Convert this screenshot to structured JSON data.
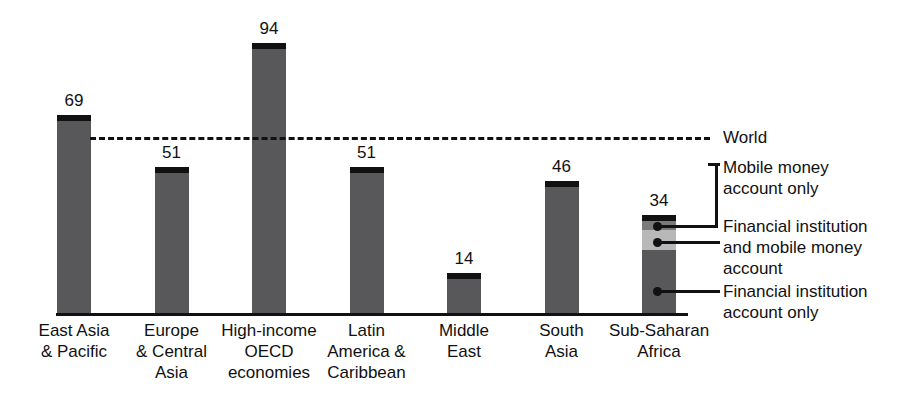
{
  "chart_data": {
    "type": "bar",
    "stacked": true,
    "title": "",
    "subtitle": "",
    "xlabel": "",
    "ylabel": "",
    "ylim": [
      0,
      100
    ],
    "grid": false,
    "categories": [
      "East Asia\n& Pacific",
      "Europe\n& Central\nAsia",
      "High-income\nOECD\neconomies",
      "Latin\nAmerica &\nCaribbean",
      "Middle\nEast",
      "South\nAsia",
      "Sub-Saharan\nAfrica"
    ],
    "totals": [
      69,
      51,
      94,
      51,
      14,
      46,
      34
    ],
    "total_labels": [
      "69",
      "51",
      "94",
      "51",
      "14",
      "46",
      "34"
    ],
    "series": [
      {
        "name": "Financial institution account only",
        "color": "#58585a",
        "values": [
          68,
          51,
          94,
          51,
          14,
          44,
          22
        ]
      },
      {
        "name": "Financial institution and mobile money account",
        "color": "#b8b8b8",
        "values": [
          0,
          0,
          0,
          0,
          0,
          2,
          7
        ]
      },
      {
        "name": "Mobile money account only",
        "color": "#7a7a7c",
        "values": [
          1,
          0,
          0,
          0,
          0,
          0,
          5
        ]
      }
    ],
    "reference_line": {
      "label": "World",
      "value": 62,
      "style": "dashed",
      "color": "#111111"
    },
    "legend": {
      "position": "right",
      "entries": [
        {
          "key": "world",
          "label": "World"
        },
        {
          "key": "mobile-money-only",
          "label": "Mobile money\naccount only"
        },
        {
          "key": "fi-and-mobile",
          "label": "Financial institution\nand mobile money\naccount"
        },
        {
          "key": "fi-only",
          "label": "Financial institution\naccount only"
        }
      ]
    },
    "annotation_target_category": "Sub-Saharan\nAfrica"
  },
  "axis": {
    "baseline_visible": true
  }
}
